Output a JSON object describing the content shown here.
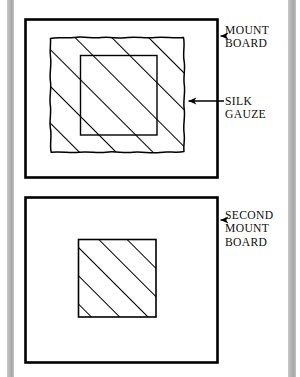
{
  "page": {
    "background_color": "#ffffff",
    "ink_color": "#000000",
    "gutter_color": "#b4b4b4",
    "width": 300,
    "height": 377
  },
  "diagram": {
    "title_implied": "Mounting silk gauze between mount boards",
    "figures": [
      {
        "id": "top-figure",
        "name": "mount-board-with-silk-gauze",
        "outer_board": {
          "x": 25,
          "y": 19,
          "width": 193,
          "height": 159
        },
        "gauze_patch": {
          "x": 50,
          "y": 37,
          "width": 135,
          "height": 115,
          "edge": "wavy",
          "fill": "diagonal-hatch"
        },
        "window_opening": {
          "x": 80,
          "y": 55,
          "width": 77,
          "height": 80
        },
        "hatch": {
          "angle_deg": 45,
          "spacing_px": 26,
          "direction": "lower-left-to-upper-right"
        }
      },
      {
        "id": "bottom-figure",
        "name": "second-mount-board-with-gauze-patch",
        "outer_board": {
          "x": 25,
          "y": 197,
          "width": 193,
          "height": 166
        },
        "gauze_patch": {
          "x": 78,
          "y": 239,
          "width": 78,
          "height": 78,
          "edge": "straight",
          "fill": "diagonal-hatch"
        },
        "hatch": {
          "angle_deg": 45,
          "spacing_px": 20,
          "direction": "lower-left-to-upper-right"
        }
      }
    ],
    "labels": [
      {
        "id": "mount-board",
        "lines": [
          "MOUNT",
          "BOARD"
        ],
        "text": "MOUNT\nBOARD",
        "arrow": {
          "from_x": 224,
          "from_y": 36,
          "to_x": 219,
          "to_y": 36,
          "head": "solid-triangle",
          "points": "left"
        }
      },
      {
        "id": "silk-gauze",
        "lines": [
          "SILK",
          "GAUZE"
        ],
        "text": "SILK\nGAUZE",
        "arrow": {
          "from_x": 224,
          "from_y": 101,
          "to_x": 186,
          "to_y": 101,
          "head": "solid-triangle",
          "points": "left"
        }
      },
      {
        "id": "second-mount-board",
        "lines": [
          "SECOND",
          "MOUNT",
          "BOARD"
        ],
        "text": "SECOND\nMOUNT\nBOARD",
        "arrow": {
          "from_x": 224,
          "from_y": 220,
          "to_x": 219,
          "to_y": 220,
          "head": "solid-triangle",
          "points": "left"
        }
      }
    ]
  }
}
